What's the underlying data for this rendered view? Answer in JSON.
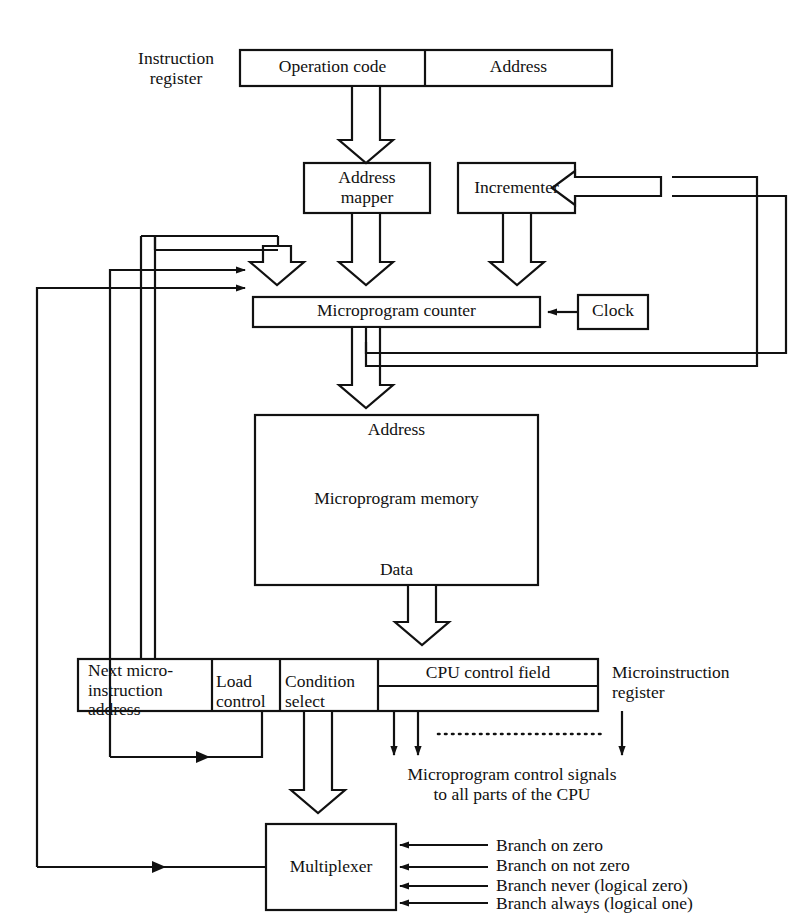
{
  "diagram": {
    "colors": {
      "line": "#111111",
      "background": "#ffffff",
      "text": "#111111"
    }
  },
  "labels": {
    "instruction_register": "Instruction\nregister",
    "operation_code": "Operation code",
    "address_field": "Address",
    "address_mapper": "Address\nmapper",
    "incrementer": "Incrementer",
    "microprogram_counter": "Microprogram counter",
    "clock": "Clock",
    "memory_address": "Address",
    "microprogram_memory": "Microprogram memory",
    "memory_data": "Data",
    "next_microinstruction_address": "Next micro-\ninstruction\naddress",
    "load_control": "Load\ncontrol",
    "condition_select": "Condition\nselect",
    "cpu_control_field": "CPU control field",
    "microinstruction_register": "Microinstruction\nregister",
    "control_signals": "Microprogram control signals\nto all parts of the CPU",
    "multiplexer": "Multiplexer"
  },
  "branch_inputs": [
    "Branch on zero",
    "Branch on not zero",
    "Branch never (logical zero)",
    "Branch always (logical one)"
  ],
  "blocks": [
    {
      "name": "instruction-register-opcode",
      "label": "Operation code"
    },
    {
      "name": "instruction-register-address",
      "label": "Address"
    },
    {
      "name": "address-mapper",
      "label": "Address mapper"
    },
    {
      "name": "incrementer",
      "label": "Incrementer"
    },
    {
      "name": "microprogram-counter",
      "label": "Microprogram counter"
    },
    {
      "name": "clock",
      "label": "Clock"
    },
    {
      "name": "microprogram-memory",
      "label": "Microprogram memory"
    },
    {
      "name": "microinstruction-register",
      "label": "Microinstruction register"
    },
    {
      "name": "multiplexer",
      "label": "Multiplexer"
    }
  ]
}
